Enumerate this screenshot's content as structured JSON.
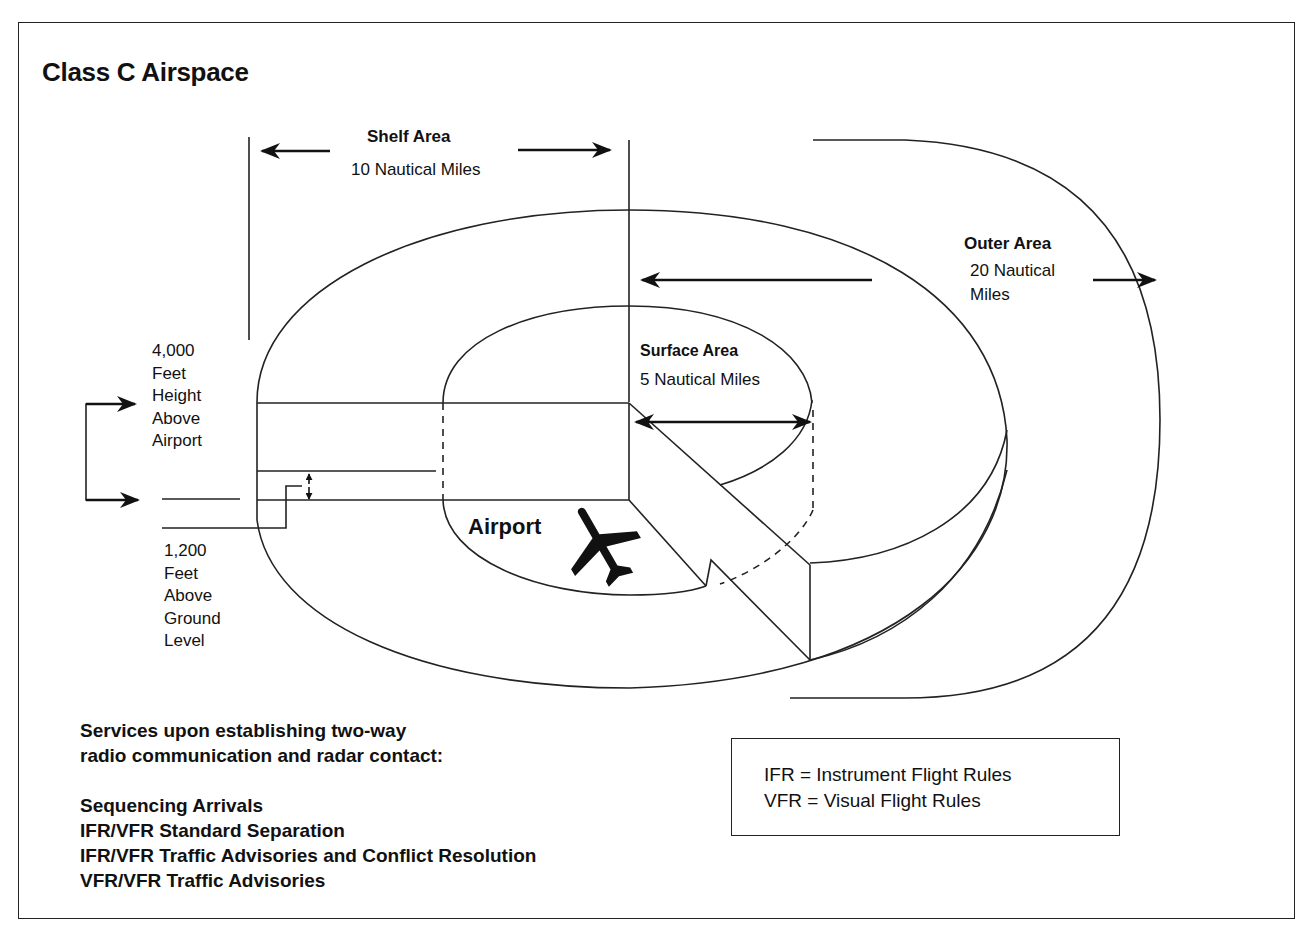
{
  "title": "Class C Airspace",
  "shelf_area": {
    "label": "Shelf Area",
    "distance": "10 Nautical Miles"
  },
  "outer_area": {
    "label": "Outer Area",
    "distance_line1": "20  Nautical",
    "distance_line2": "Miles"
  },
  "surface_area": {
    "label": "Surface Area",
    "distance": "5 Nautical Miles"
  },
  "airport_label": "Airport",
  "ceiling": {
    "lines": [
      "4,000",
      "Feet",
      "Height",
      "Above",
      "Airport"
    ]
  },
  "floor": {
    "lines": [
      "1,200",
      "Feet",
      "Above",
      "Ground",
      "Level"
    ]
  },
  "services": {
    "intro_line1": "Services upon establishing two-way",
    "intro_line2": "radio communication and radar contact:",
    "items": [
      "Sequencing Arrivals",
      "IFR/VFR Standard Separation",
      "IFR/VFR Traffic Advisories and Conflict Resolution",
      "VFR/VFR Traffic Advisories"
    ]
  },
  "legend": {
    "ifr": "IFR = Instrument Flight Rules",
    "vfr": "VFR = Visual Flight Rules"
  },
  "icons": {
    "airplane": "airplane-icon",
    "arrows": "double-headed-arrow-icon"
  },
  "colors": {
    "line": "#222222",
    "background": "#ffffff",
    "text": "#111111"
  }
}
